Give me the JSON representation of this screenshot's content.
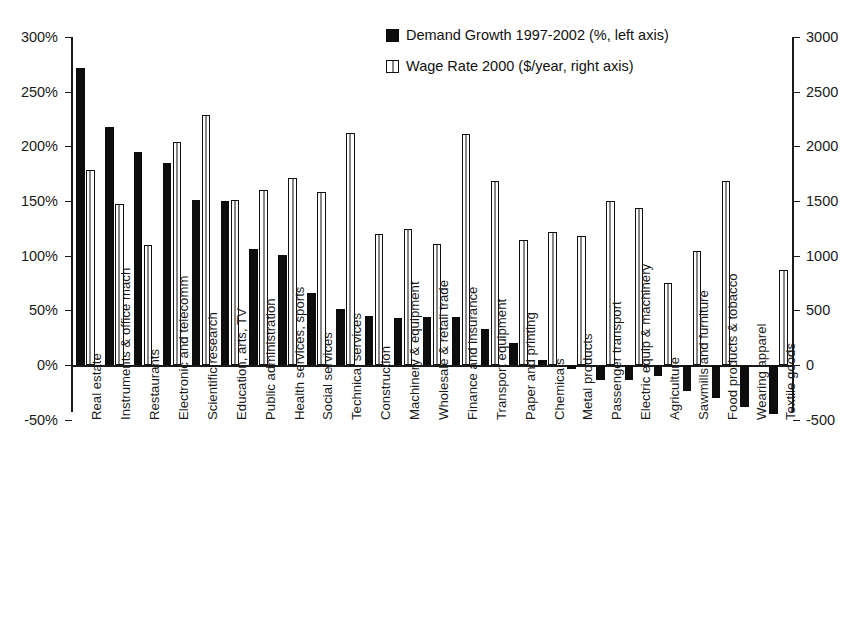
{
  "chart_data": {
    "type": "bar",
    "title": "",
    "subtitle": "",
    "xlabel": "",
    "ylabel": "",
    "y2label": "",
    "grid": false,
    "legend_position": "top-center",
    "ylim": [
      -50,
      300
    ],
    "y2lim": [
      -500,
      3000
    ],
    "yticks": [
      "300%",
      "250%",
      "200%",
      "150%",
      "100%",
      "50%",
      "0%",
      "-50%"
    ],
    "ytick_values": [
      300,
      250,
      200,
      150,
      100,
      50,
      0,
      -50
    ],
    "y2ticks": [
      "3000",
      "2500",
      "2000",
      "1500",
      "1000",
      "500",
      "0",
      "-500"
    ],
    "y2tick_values": [
      3000,
      2500,
      2000,
      1500,
      1000,
      500,
      0,
      -500
    ],
    "categories": [
      "Real estate",
      "Instruments & office mach",
      "Restaurants",
      "Electronic and telecomm",
      "Scientific research",
      "Education, arts, TV",
      "Public administration",
      "Health services, sports",
      "Social services",
      "Technical services",
      "Construction",
      "Machinery & equipment",
      "Wholesale & retail trade",
      "Finance and insurance",
      "Transport equipment",
      "Paper and printing",
      "Chemicals",
      "Metal products",
      "Passenger transport",
      "Electric equip & machinery",
      "Agriculture",
      "Sawmills and furniture",
      "Food products & tobacco",
      "Wearing apparel",
      "Textile goods"
    ],
    "series": [
      {
        "name": "Demand Growth 1997-2002 (%, left axis)",
        "axis": "left",
        "style": "solid-black",
        "unit": "%",
        "values": [
          272,
          218,
          195,
          185,
          151,
          150,
          106,
          101,
          66,
          51,
          45,
          43,
          44,
          44,
          33,
          20,
          5,
          -4,
          -14,
          -14,
          -10,
          -24,
          -30,
          -38,
          -45
        ]
      },
      {
        "name": "Wage Rate 2000 ($/year, right axis)",
        "axis": "right",
        "style": "hollow-white",
        "unit": "$/year",
        "values": [
          1780,
          1470,
          1100,
          2040,
          2290,
          1510,
          1600,
          1710,
          1580,
          2120,
          1200,
          1240,
          1110,
          2110,
          1680,
          1140,
          1220,
          1180,
          1500,
          1440,
          750,
          1040,
          1680,
          0,
          870
        ]
      }
    ]
  },
  "legend": {
    "entries": [
      {
        "label": "Demand Growth 1997-2002 (%, left axis)",
        "swatch": "dark"
      },
      {
        "label": "Wage Rate 2000 ($/year, right axis)",
        "swatch": "light"
      }
    ]
  },
  "colors": {
    "series_demand": "#0d0d0d",
    "series_wage": "#ffffff",
    "axis": "#1a1a1a",
    "background": "#ffffff"
  }
}
